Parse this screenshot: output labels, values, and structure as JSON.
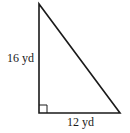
{
  "diagram": {
    "type": "right-triangle",
    "vertices": {
      "top": [
        39,
        4
      ],
      "bottom_left": [
        39,
        113
      ],
      "bottom_right": [
        120,
        113
      ]
    },
    "right_angle_at": "bottom_left",
    "labels": {
      "vertical_leg": "16 yd",
      "horizontal_leg": "12 yd"
    },
    "stroke_color": "#1a1a1a"
  }
}
